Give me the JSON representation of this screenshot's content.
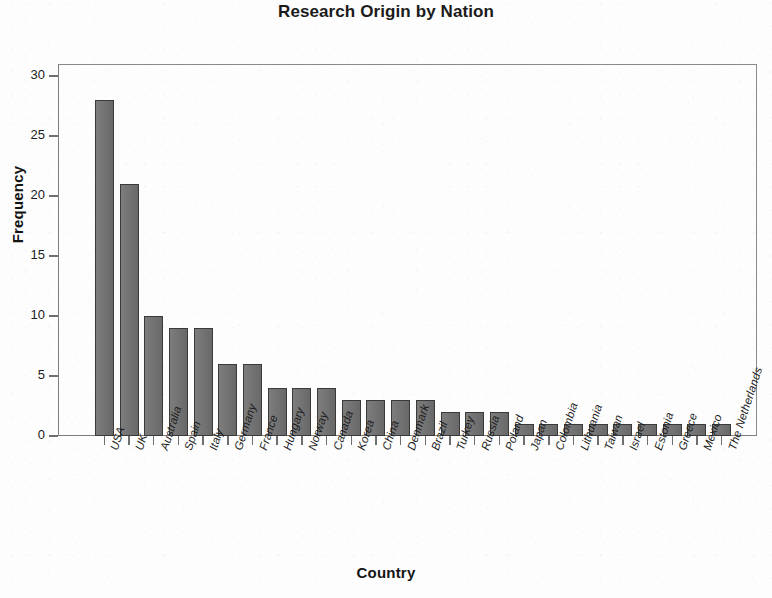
{
  "chart_data": {
    "type": "bar",
    "title": "Research Origin by Nation",
    "xlabel": "Country",
    "ylabel": "Frequency",
    "ylim": [
      0,
      31
    ],
    "ytick_values": [
      0,
      5,
      10,
      15,
      20,
      25,
      30
    ],
    "ytick_labels": [
      "0",
      "5",
      "10",
      "15",
      "20",
      "25",
      "30"
    ],
    "grid": false,
    "legend": null,
    "bar_color": "#6e6e6e",
    "bar_edge_color": "#3a3a3a",
    "frame_color": "#7e7e7e",
    "background_color": "#fdfdfd",
    "categories": [
      "USA",
      "UK",
      "Australia",
      "Spain",
      "Italy",
      "Germany",
      "France",
      "Hungary",
      "Norway",
      "Canada",
      "Korea",
      "China",
      "Denmark",
      "Brazil",
      "Turkey",
      "Russia",
      "Poland",
      "Japan",
      "Colombia",
      "Lithuania",
      "Taiwan",
      "Israel",
      "Estonia",
      "Greece",
      "Mexico",
      "The Netherlands"
    ],
    "values": [
      28,
      21,
      10,
      9,
      9,
      6,
      6,
      4,
      4,
      4,
      3,
      3,
      3,
      3,
      2,
      2,
      2,
      1,
      1,
      1,
      1,
      1,
      1,
      1,
      1,
      1
    ]
  }
}
